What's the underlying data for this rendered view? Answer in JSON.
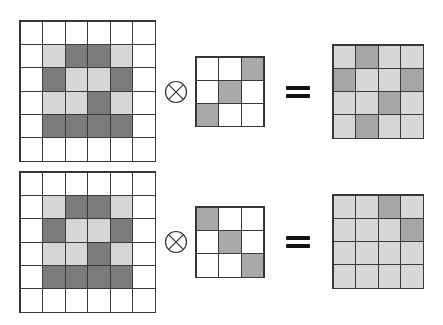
{
  "palette": {
    "W": "#ffffff",
    "L": "#d6d6d6",
    "D": "#7b7b7b",
    "G": "#a9a9a9",
    "M": "#a6a6a6"
  },
  "operator_symbol": "convolution (circled times)",
  "equals_symbol": "=",
  "rows": [
    {
      "input": [
        [
          "W",
          "W",
          "W",
          "W",
          "W",
          "W"
        ],
        [
          "W",
          "L",
          "D",
          "D",
          "L",
          "W"
        ],
        [
          "W",
          "D",
          "L",
          "L",
          "D",
          "W"
        ],
        [
          "W",
          "L",
          "L",
          "D",
          "L",
          "W"
        ],
        [
          "W",
          "D",
          "D",
          "D",
          "D",
          "W"
        ],
        [
          "W",
          "W",
          "W",
          "W",
          "W",
          "W"
        ]
      ],
      "kernel": [
        [
          "W",
          "W",
          "G"
        ],
        [
          "W",
          "G",
          "W"
        ],
        [
          "G",
          "W",
          "W"
        ]
      ],
      "output": [
        [
          "L",
          "M",
          "L",
          "L"
        ],
        [
          "M",
          "L",
          "L",
          "M"
        ],
        [
          "L",
          "L",
          "M",
          "L"
        ],
        [
          "L",
          "M",
          "L",
          "L"
        ]
      ]
    },
    {
      "input": [
        [
          "W",
          "W",
          "W",
          "W",
          "W",
          "W"
        ],
        [
          "W",
          "L",
          "D",
          "D",
          "L",
          "W"
        ],
        [
          "W",
          "D",
          "L",
          "L",
          "D",
          "W"
        ],
        [
          "W",
          "L",
          "L",
          "D",
          "L",
          "W"
        ],
        [
          "W",
          "D",
          "D",
          "D",
          "D",
          "W"
        ],
        [
          "W",
          "W",
          "W",
          "W",
          "W",
          "W"
        ]
      ],
      "kernel": [
        [
          "G",
          "W",
          "W"
        ],
        [
          "W",
          "G",
          "W"
        ],
        [
          "W",
          "W",
          "G"
        ]
      ],
      "output": [
        [
          "L",
          "L",
          "M",
          "L"
        ],
        [
          "L",
          "L",
          "L",
          "M"
        ],
        [
          "L",
          "L",
          "L",
          "L"
        ],
        [
          "L",
          "L",
          "L",
          "L"
        ]
      ]
    }
  ]
}
